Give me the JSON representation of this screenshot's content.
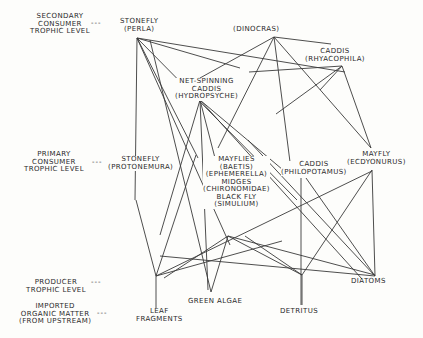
{
  "trophic_levels": {
    "secondary": [
      "SECONDARY",
      "CONSUMER",
      "TROPHIC LEVEL"
    ],
    "primary": [
      "PRIMARY",
      "CONSUMER",
      "TROPHIC LEVEL"
    ],
    "producer": [
      "PRODUCER",
      "TROPHIC LEVEL"
    ],
    "imported": [
      "IMPORTED",
      "ORGANIC MATTER",
      "(FROM UPSTREAM)"
    ],
    "dash": "---"
  },
  "nodes": {
    "perla": [
      "STONEFLY",
      "(PERLA)"
    ],
    "dinocras": [
      "(DINOCRAS)"
    ],
    "rhyacophila": [
      "CADDIS",
      "(RHYACOPHILA)"
    ],
    "hydropsyche": [
      "NET-SPINNING",
      "CADDIS",
      "(HYDROPSYCHE)"
    ],
    "protonemura": [
      "STONEFLY",
      "(PROTONEMURA)"
    ],
    "mayflies_group": [
      "MAYFLIES",
      "(BAETIS)",
      "(EPHEMERELLA)",
      "MIDGES",
      "(CHIRONOMIDAE)",
      "BLACK FLY",
      "(SIMULIUM)"
    ],
    "philopotamus": [
      "CADDIS",
      "(PHILOPOTAMUS)"
    ],
    "ecdyonurus": [
      "MAYFLY",
      "(ECDYONURUS)"
    ],
    "leaf_fragments": [
      "LEAF",
      "FRAGMENTS"
    ],
    "green_algae": [
      "GREEN ALGAE"
    ],
    "detritus": [
      "DETRITUS"
    ],
    "diatoms": [
      "DIATOMS"
    ]
  },
  "colors": {
    "line": "#3a3a3a",
    "text": "#2a2a2a",
    "background": "#fdfdfb"
  }
}
